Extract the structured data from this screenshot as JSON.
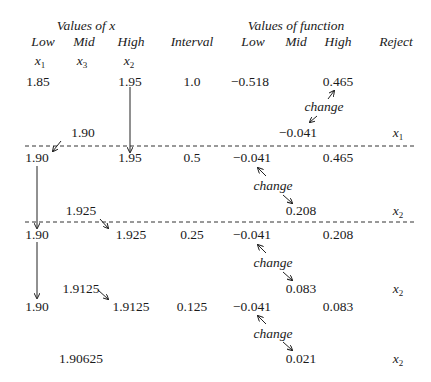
{
  "headers": {
    "group_x": "Values of x",
    "group_f": "Values of function",
    "low": "Low",
    "mid": "Mid",
    "high": "High",
    "interval": "Interval",
    "f_low": "Low",
    "f_mid": "Mid",
    "f_high": "High",
    "reject": "Reject",
    "sub_low_var": "x",
    "sub_low_idx": "1",
    "sub_mid_var": "x",
    "sub_mid_idx": "3",
    "sub_high_var": "x",
    "sub_high_idx": "2"
  },
  "change_label": "change",
  "rows": [
    {
      "low": "1.85",
      "high": "1.95",
      "interval": "1.0",
      "f_low": "−0.518",
      "f_high": "0.465",
      "mid": "1.90",
      "f_mid": "−0.041",
      "reject_var": "x",
      "reject_idx": "1"
    },
    {
      "low": "1.90",
      "high": "1.95",
      "interval": "0.5",
      "f_low": "−0.041",
      "f_high": "0.465",
      "mid": "1.925",
      "f_mid": "0.208",
      "reject_var": "x",
      "reject_idx": "2"
    },
    {
      "low": "1.90",
      "high": "1.925",
      "interval": "0.25",
      "f_low": "−0.041",
      "f_high": "0.208",
      "mid": "1.9125",
      "f_mid": "0.083",
      "reject_var": "x",
      "reject_idx": "2"
    },
    {
      "low": "1.90",
      "high": "1.9125",
      "interval": "0.125",
      "f_low": "−0.041",
      "f_high": "0.083",
      "mid": "1.90625",
      "f_mid": "0.021",
      "reject_var": "x",
      "reject_idx": "2"
    }
  ]
}
